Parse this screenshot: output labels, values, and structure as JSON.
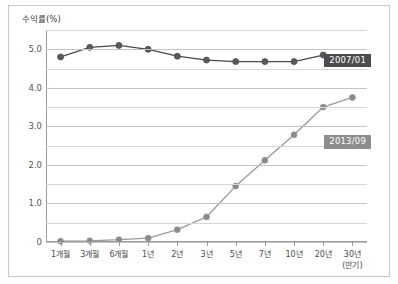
{
  "chart_data": {
    "type": "line",
    "title": "",
    "ylabel": "수익률(%)",
    "xlabel": "(만기)",
    "categories": [
      "1개월",
      "3개월",
      "6개월",
      "1년",
      "2년",
      "3년",
      "5년",
      "7년",
      "10년",
      "20년",
      "30년"
    ],
    "ylim": [
      0,
      5.5
    ],
    "yticks": [
      0,
      1.0,
      2.0,
      3.0,
      4.0,
      5.0
    ],
    "ytick_labels": [
      "0",
      "1.0",
      "2.0",
      "3.0",
      "4.0",
      "5.0"
    ],
    "minor_yticks": [
      0.5,
      1.5,
      2.5,
      3.5,
      4.5,
      5.5
    ],
    "grid": true,
    "legend_position": "inline-right",
    "series": [
      {
        "name": "2007/01",
        "color": "#4a4a4a",
        "marker_color": "#5a5a5a",
        "label_bg": "#4c4c4c",
        "values": [
          4.8,
          5.05,
          5.1,
          5.0,
          4.82,
          4.72,
          4.68,
          4.68,
          4.68,
          4.85,
          4.78
        ]
      },
      {
        "name": "2013/09",
        "color": "#9a9a9a",
        "marker_color": "#8a8a8a",
        "label_bg": "#8d8d8d",
        "values": [
          0.02,
          0.03,
          0.06,
          0.1,
          0.32,
          0.65,
          1.45,
          2.12,
          2.78,
          3.5,
          3.75
        ]
      }
    ]
  }
}
